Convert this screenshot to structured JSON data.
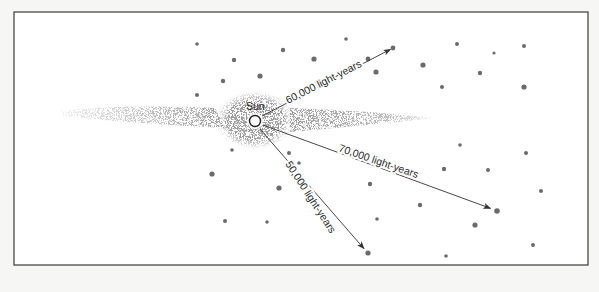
{
  "figure": {
    "colors": {
      "background": "#f6f6f5",
      "frame_fill": "#ffffff",
      "frame_stroke": "#3a3a3a",
      "disk_speckle": "#5a5a5a",
      "cluster": "#6b6b6b",
      "arrow": "#333333",
      "text": "#2a2a2a",
      "sun_fill": "#ffffff",
      "sun_stroke": "#222222"
    },
    "frame": {
      "x": 14,
      "y": 12,
      "width": 574,
      "height": 253
    },
    "galaxy": {
      "center": [
        255,
        121
      ],
      "disk_left_x": 60,
      "disk_right_x": 435,
      "disk_y": 117,
      "bulge_rx": 38,
      "bulge_ry": 28
    },
    "sun": {
      "label": "Sun",
      "x": 255,
      "y": 121,
      "r": 5.5,
      "label_x": 246,
      "label_y": 110
    },
    "distances": [
      {
        "label": "60,000 light-years",
        "from": [
          262,
          116
        ],
        "to": [
          393,
          48
        ],
        "label_x": 288,
        "label_y": 104,
        "label_angle": -27
      },
      {
        "label": "70,000 light-years",
        "from": [
          263,
          125
        ],
        "to": [
          495,
          210
        ],
        "label_x": 338,
        "label_y": 151,
        "label_angle": 19
      },
      {
        "label": "50,000 light-years",
        "from": [
          260,
          129
        ],
        "to": [
          366,
          251
        ],
        "label_x": 285,
        "label_y": 164,
        "label_angle": 57
      }
    ],
    "clusters": [
      [
        197,
        44,
        1.8
      ],
      [
        234,
        60,
        2.2
      ],
      [
        283,
        50,
        2.2
      ],
      [
        223,
        81,
        2.2
      ],
      [
        260,
        76,
        2.6
      ],
      [
        197,
        95,
        2.0
      ],
      [
        314,
        59,
        2.6
      ],
      [
        346,
        39,
        1.8
      ],
      [
        368,
        59,
        2.4
      ],
      [
        376,
        72,
        2.6
      ],
      [
        393,
        48,
        2.4
      ],
      [
        457,
        44,
        2.0
      ],
      [
        494,
        53,
        1.6
      ],
      [
        524,
        46,
        2.0
      ],
      [
        423,
        65,
        2.6
      ],
      [
        480,
        73,
        2.2
      ],
      [
        442,
        87,
        2.0
      ],
      [
        524,
        87,
        2.6
      ],
      [
        232,
        150,
        1.8
      ],
      [
        289,
        153,
        2.0
      ],
      [
        299,
        163,
        1.8
      ],
      [
        212,
        174,
        2.6
      ],
      [
        279,
        188,
        2.6
      ],
      [
        225,
        221,
        2.0
      ],
      [
        267,
        222,
        1.8
      ],
      [
        460,
        145,
        1.8
      ],
      [
        526,
        153,
        2.0
      ],
      [
        444,
        169,
        2.2
      ],
      [
        488,
        170,
        2.0
      ],
      [
        370,
        184,
        2.2
      ],
      [
        541,
        191,
        2.0
      ],
      [
        420,
        205,
        2.2
      ],
      [
        497,
        211,
        2.8
      ],
      [
        377,
        219,
        1.8
      ],
      [
        475,
        225,
        2.6
      ],
      [
        533,
        245,
        2.0
      ],
      [
        368,
        253,
        2.6
      ],
      [
        446,
        256,
        1.8
      ]
    ]
  }
}
